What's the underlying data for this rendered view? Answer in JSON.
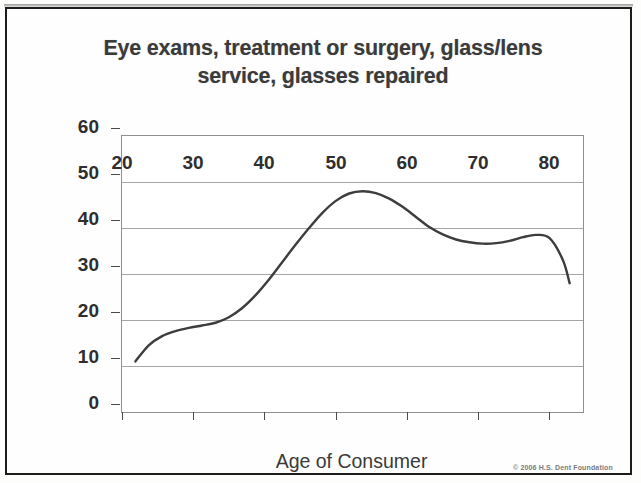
{
  "chart_data": {
    "type": "line",
    "title": "Eye exams, treatment or surgery, glass/lens service, glasses repaired",
    "title_line1": "Eye exams, treatment or surgery, glass/lens",
    "title_line2": "service, glasses repaired",
    "xlabel": "Age of Consumer",
    "ylabel": "Avg. Annual Expenditure",
    "xlim": [
      18,
      87
    ],
    "ylim": [
      0,
      60
    ],
    "xticks": [
      20,
      30,
      40,
      50,
      60,
      70,
      80
    ],
    "yticks": [
      0,
      10,
      20,
      30,
      40,
      50,
      60
    ],
    "grid": true,
    "legend": "none",
    "line_color": "#3d3d3d",
    "series": [
      {
        "name": "Avg. Annual Expenditure",
        "x": [
          20,
          22,
          24,
          26,
          28,
          30,
          32,
          34,
          36,
          38,
          40,
          42,
          44,
          46,
          48,
          50,
          52,
          54,
          56,
          58,
          60,
          62,
          64,
          66,
          68,
          70,
          72,
          74,
          76,
          78,
          80,
          82,
          84,
          85
        ],
        "values": [
          11.0,
          14.5,
          16.5,
          17.6,
          18.3,
          18.8,
          19.4,
          20.6,
          22.6,
          25.4,
          28.8,
          32.6,
          36.4,
          40.0,
          43.3,
          45.9,
          47.5,
          48.0,
          47.6,
          46.4,
          44.6,
          42.4,
          40.2,
          38.6,
          37.5,
          36.9,
          36.6,
          36.7,
          37.2,
          38.0,
          38.5,
          37.8,
          33.0,
          28.0
        ]
      }
    ],
    "annotations": {
      "peak_age": 54,
      "peak_value": 48.0,
      "local_min_age": 72,
      "local_min_value": 36.6,
      "second_bump_age": 80,
      "second_bump_value": 38.5
    }
  },
  "axes": {
    "y_title": "Avg. Annual Expenditure",
    "x_title": "Age of Consumer",
    "y_labels": [
      "60",
      "50",
      "40",
      "30",
      "20",
      "10",
      "0"
    ],
    "x_labels": [
      "20",
      "30",
      "40",
      "50",
      "60",
      "70",
      "80"
    ]
  },
  "footer": {
    "copyright": "© 2006 H.S. Dent Foundation"
  },
  "colors": {
    "frame": "#1c1c1c",
    "title_text": "#3b3b3b",
    "axis_text": "#2e2e2e",
    "gridline": "#a6a6a6",
    "curve": "#3d3d3d",
    "background": "#fefefe"
  }
}
